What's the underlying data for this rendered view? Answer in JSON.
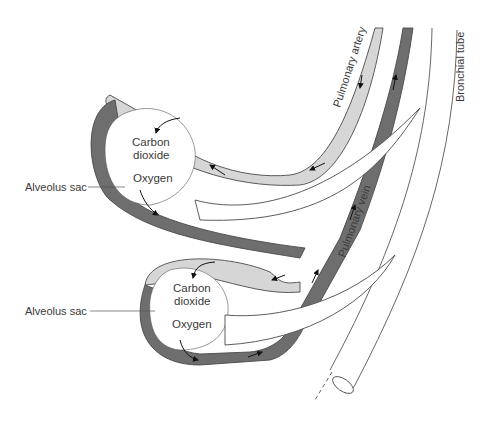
{
  "diagram": {
    "type": "anatomical illustration",
    "colors": {
      "artery": "#d6d6d6",
      "vein": "#6e6e6e",
      "outline": "#4a4a4a",
      "text": "#3a3a3a"
    },
    "labels": {
      "pulmonary_artery": "Pulmonary artery",
      "pulmonary_vein": "Pulmonary vein",
      "bronchial_tube": "Bronchial tube"
    },
    "alveoli": [
      {
        "label": "Alveolus sac",
        "co2": [
          "Carbon",
          "dioxide"
        ],
        "o2": "Oxygen"
      },
      {
        "label": "Alveolus sac",
        "co2": [
          "Carbon",
          "dioxide"
        ],
        "o2": "Oxygen"
      }
    ]
  }
}
